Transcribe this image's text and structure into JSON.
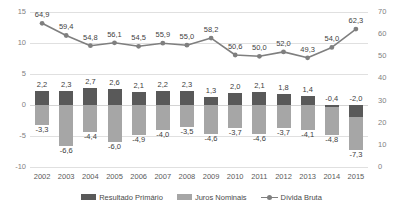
{
  "chart_data": {
    "type": "bar",
    "title": "",
    "subtitle": "",
    "xlabel": "",
    "ylabel": "",
    "ylabel_right": "",
    "categories": [
      "2002",
      "2003",
      "2004",
      "2005",
      "2006",
      "2007",
      "2008",
      "2009",
      "2010",
      "2011",
      "2012",
      "2013",
      "2014",
      "2015"
    ],
    "left_axis": {
      "ticks": [
        "15",
        "10",
        "5",
        "0",
        "-5",
        "-10"
      ],
      "tick_values": [
        15,
        10,
        5,
        0,
        -5,
        -10
      ],
      "ylim": [
        -10,
        15
      ]
    },
    "right_axis": {
      "ticks": [
        "70",
        "60",
        "50",
        "40",
        "30",
        "20",
        "10",
        "0"
      ],
      "tick_values": [
        70,
        60,
        50,
        40,
        30,
        20,
        10,
        0
      ],
      "ylim": [
        0,
        70
      ]
    },
    "grid": true,
    "legend_position": "bottom",
    "series": [
      {
        "name": "Resultado Primário",
        "type": "bar",
        "axis": "left",
        "color": "#595959",
        "values": [
          2.2,
          2.3,
          2.7,
          2.6,
          2.1,
          2.2,
          2.3,
          1.3,
          2.0,
          2.1,
          1.8,
          1.4,
          -0.4,
          -2.0
        ],
        "labels": [
          "2,2",
          "2,3",
          "2,7",
          "2,6",
          "2,1",
          "2,2",
          "2,3",
          "1,3",
          "2,0",
          "2,1",
          "1,8",
          "1,4",
          "-0,4",
          "-2,0"
        ]
      },
      {
        "name": "Juros Nominais",
        "type": "bar",
        "axis": "left",
        "color": "#a6a6a6",
        "values": [
          -3.3,
          -6.6,
          -4.4,
          -6.0,
          -4.9,
          -4.0,
          -3.5,
          -4.6,
          -3.7,
          -4.6,
          -3.7,
          -4.1,
          -4.8,
          -7.3
        ],
        "labels": [
          "-3,3",
          "-6,6",
          "-4,4",
          "-6,0",
          "-4,9",
          "-4,0",
          "-3,5",
          "-4,6",
          "-3,7",
          "-4,6",
          "-3,7",
          "-4,1",
          "-4,8",
          "-7,3"
        ]
      },
      {
        "name": "Dívida Bruta",
        "type": "line",
        "axis": "right",
        "color": "#7f7f7f",
        "values": [
          64.9,
          59.4,
          54.8,
          56.1,
          54.5,
          55.9,
          55.0,
          58.2,
          50.6,
          50.0,
          52.0,
          49.3,
          54.0,
          62.3
        ],
        "labels": [
          "64,9",
          "59,4",
          "54,8",
          "56,1",
          "54,5",
          "55,9",
          "55,0",
          "58,2",
          "50,6",
          "50,0",
          "52,0",
          "49,3",
          "54,0",
          "62,3"
        ]
      }
    ]
  },
  "legend": {
    "items": [
      {
        "label": "Resultado Primário",
        "marker": "swatch-dark",
        "color": "#595959"
      },
      {
        "label": "Juros Nominais",
        "marker": "swatch-light",
        "color": "#a6a6a6"
      },
      {
        "label": "Dívida Bruta",
        "marker": "line-marker",
        "color": "#7f7f7f"
      }
    ]
  }
}
